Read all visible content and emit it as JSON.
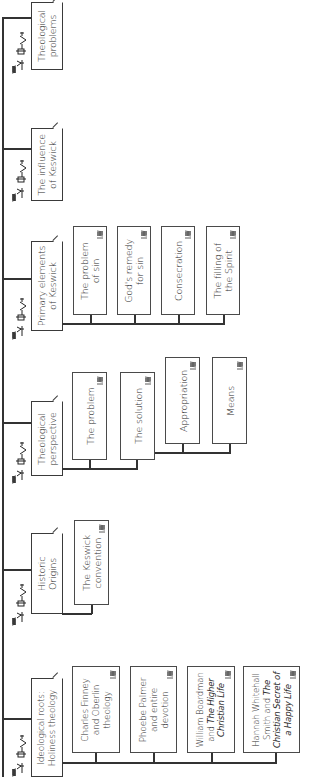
{
  "diagram": {
    "orientation": "rotated-90-ccw",
    "line_color": "#333333",
    "heads": [
      {
        "id": "theological-problems",
        "label": "Theological problems",
        "lines": [
          "Theological",
          "problems"
        ],
        "icon": "people-crowd-icon",
        "children": []
      },
      {
        "id": "influence-of-keswick",
        "label": "The influence of Keswick",
        "lines": [
          "The influence",
          "of Keswick"
        ],
        "icon": "people-crowd-icon",
        "children": []
      },
      {
        "id": "primary-elements",
        "label": "Primary elements of Keswick",
        "lines": [
          "Primary elements",
          "of Keswick"
        ],
        "icon": "people-crowd-icon",
        "children": [
          {
            "lines": [
              "The problem",
              "of sin"
            ]
          },
          {
            "lines": [
              "God's remedy",
              "for sin"
            ]
          },
          {
            "lines": [
              "Consecration"
            ]
          },
          {
            "lines": [
              "The filling of",
              "the Spirit"
            ]
          }
        ]
      },
      {
        "id": "theological-perspective",
        "label": "Theological perspective",
        "lines": [
          "Theological",
          "perspective"
        ],
        "icon": "people-crowd-icon",
        "children": [
          {
            "lines": [
              "The problem"
            ]
          },
          {
            "lines": [
              "The solution"
            ]
          },
          {
            "lines": [
              "Appropriation"
            ]
          },
          {
            "lines": [
              "Means"
            ]
          }
        ]
      },
      {
        "id": "historic-origins",
        "label": "Historic Origins",
        "lines": [
          "Historic",
          "Origins"
        ],
        "icon": "people-crowd-icon",
        "children": [
          {
            "lines": [
              "The Keswick",
              "convention"
            ]
          }
        ]
      },
      {
        "id": "ideological-roots",
        "label": "Ideological roots: Holiness theology",
        "lines": [
          "Ideological roots:",
          "Holiness theology"
        ],
        "icon": "people-crowd-icon",
        "children": [
          {
            "lines": [
              "Charles Finney",
              "and Oberlin",
              "theology"
            ]
          },
          {
            "lines": [
              "Phoebe Palmer",
              "and entire",
              "devotion"
            ]
          },
          {
            "lines": [
              "William Boardman",
              "and The Higher",
              "Christian Life"
            ],
            "italic_spans": [
              "The Higher",
              "Christian Life"
            ]
          },
          {
            "lines": [
              "Hannah Whitehall",
              "Smith and The",
              "Christian Secret of",
              "a Happy Life"
            ],
            "italic_spans": [
              "The",
              "Christian Secret of",
              "a Happy Life"
            ]
          }
        ]
      }
    ]
  }
}
